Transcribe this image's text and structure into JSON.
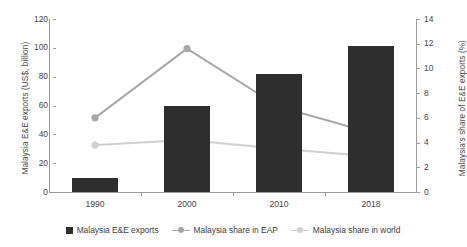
{
  "chart_data": {
    "type": "bar",
    "title": "",
    "subtitle": "",
    "categories": [
      "1990",
      "2000",
      "2010",
      "2018"
    ],
    "xlabel": "",
    "grid": false,
    "legend_position": "bottom",
    "axes": {
      "left": {
        "label": "Malaysia E&E exports (US$, billion)",
        "ticks": [
          "0",
          "20",
          "40",
          "60",
          "80",
          "100",
          "120"
        ],
        "tick_values": [
          0,
          20,
          40,
          60,
          80,
          100,
          120
        ],
        "lim": [
          0,
          120
        ]
      },
      "right": {
        "label": "Malaysia's share of E&E exports (%)",
        "ticks": [
          "0",
          "2",
          "4",
          "6",
          "8",
          "10",
          "12",
          "14"
        ],
        "tick_values": [
          0,
          2,
          4,
          6,
          8,
          10,
          12,
          14
        ],
        "lim": [
          0,
          14
        ]
      }
    },
    "series": [
      {
        "name": "Malaysia E&E exports",
        "type": "bar",
        "axis": "left",
        "color": "#2e2e2e",
        "values": [
          10,
          60,
          82,
          101
        ]
      },
      {
        "name": "Malaysia share in EAP",
        "type": "line",
        "axis": "right",
        "color": "#a8a8a8",
        "values": [
          6.0,
          11.6,
          6.9,
          4.8
        ]
      },
      {
        "name": "Malaysia share in world",
        "type": "line",
        "axis": "right",
        "color": "#cfcfcf",
        "values": [
          3.8,
          4.2,
          3.5,
          2.9
        ]
      }
    ]
  },
  "legend": {
    "items": [
      {
        "label": "Malaysia E&E exports",
        "marker": "square-swatch",
        "color": "#2e2e2e"
      },
      {
        "label": "Malaysia share in EAP",
        "marker": "line-marker-swatch",
        "color": "#a8a8a8"
      },
      {
        "label": "Malaysia share in world",
        "marker": "line-marker-swatch",
        "color": "#cfcfcf"
      }
    ]
  }
}
